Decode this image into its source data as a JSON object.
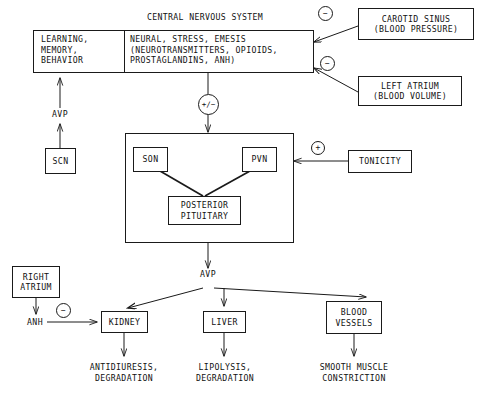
{
  "diagram": {
    "title": "CENTRAL NERVOUS SYSTEM",
    "colors": {
      "ink": "#111111",
      "stroke": "#1a1a1a",
      "background": "#ffffff"
    },
    "nodes": {
      "cns_title": "CENTRAL NERVOUS SYSTEM",
      "cns_left": "LEARNING,\nMEMORY,\nBEHAVIOR",
      "cns_right": "NEURAL, STRESS, EMESIS\n(NEUROTRANSMITTERS, OPIOIDS,\nPROSTAGLANDINS, ANH)",
      "carotid_sinus": "CAROTID SINUS\n(BLOOD PRESSURE)",
      "left_atrium": "LEFT ATRIUM\n(BLOOD VOLUME)",
      "scn": "SCN",
      "son": "SON",
      "pvn": "PVN",
      "posterior_pituitary": "POSTERIOR\nPITUITARY",
      "tonicity": "TONICITY",
      "right_atrium": "RIGHT\nATRIUM",
      "kidney": "KIDNEY",
      "liver": "LIVER",
      "blood_vessels": "BLOOD\nVESSELS",
      "antidiuresis": "ANTIDIURESIS,\nDEGRADATION",
      "lipolysis": "LIPOLYSIS,\nDEGRADATION",
      "smooth_muscle": "SMOOTH MUSCLE\nCONSTRICTION"
    },
    "edge_labels": {
      "avp_scn_to_cns": "AVP",
      "avp_pituitary_out": "AVP",
      "anh": "ANH"
    },
    "signs": {
      "carotid_sinus_sign": "−",
      "left_atrium_sign": "−",
      "cns_to_hypothalamus_sign": "+/−",
      "tonicity_sign": "+",
      "anh_kidney_sign": "−"
    }
  }
}
